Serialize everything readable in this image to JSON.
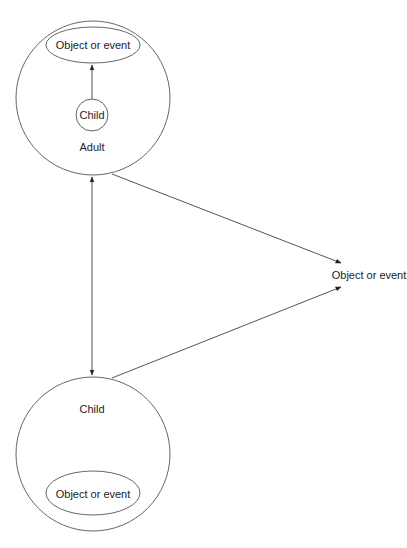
{
  "diagram": {
    "adult_node": {
      "label": "Adult",
      "inner_object_label": "Object or event",
      "inner_child_label": "Child"
    },
    "child_node": {
      "label": "Child",
      "inner_object_label": "Object or event"
    },
    "external_object": {
      "label": "Object or event"
    },
    "colors": {
      "stroke": "#555555",
      "text": "#222222",
      "background": "#ffffff"
    }
  }
}
